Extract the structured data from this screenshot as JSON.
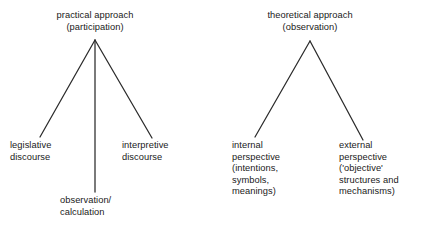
{
  "diagram": {
    "background_color": "#ffffff",
    "line_color": "#2b2b2b",
    "text_color": "#1a1a1a",
    "trees": [
      {
        "id": "practical",
        "root": {
          "name": "practical-approach-root",
          "text": "practical approach\n(participation)"
        },
        "leaves": [
          {
            "name": "legislative-discourse-leaf",
            "text": "legislative\ndiscourse"
          },
          {
            "name": "observation-calculation-leaf",
            "text": "observation/\ncalculation"
          },
          {
            "name": "interpretive-discourse-leaf",
            "text": "interpretive\ndiscourse"
          }
        ]
      },
      {
        "id": "theoretical",
        "root": {
          "name": "theoretical-approach-root",
          "text": "theoretical approach\n(observation)"
        },
        "leaves": [
          {
            "name": "internal-perspective-leaf",
            "text": "internal\nperspective\n(intentions,\nsymbols,\nmeanings)"
          },
          {
            "name": "external-perspective-leaf",
            "text": "external\nperspective\n('objective'\nstructures and\nmechanisms)"
          }
        ]
      }
    ],
    "edges": [
      {
        "name": "edge-practical-to-legislative",
        "x1": 95,
        "y1": 40,
        "x2": 40,
        "y2": 137
      },
      {
        "name": "edge-practical-to-observation",
        "x1": 95,
        "y1": 40,
        "x2": 95,
        "y2": 192
      },
      {
        "name": "edge-practical-to-interpretive",
        "x1": 95,
        "y1": 40,
        "x2": 152,
        "y2": 138
      },
      {
        "name": "edge-theoretical-to-internal",
        "x1": 310,
        "y1": 41,
        "x2": 255,
        "y2": 137
      },
      {
        "name": "edge-theoretical-to-external",
        "x1": 310,
        "y1": 41,
        "x2": 363,
        "y2": 140
      }
    ]
  }
}
